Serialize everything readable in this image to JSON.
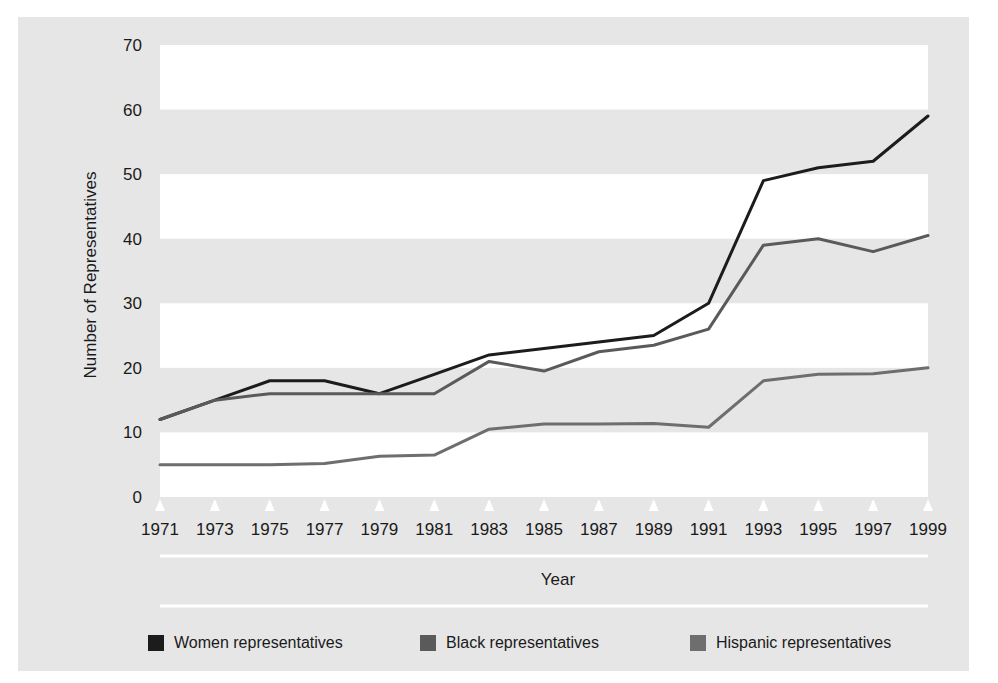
{
  "figure": {
    "background_color": "#ffffff",
    "panel_color": "#e6e6e6",
    "band_color": "#ffffff"
  },
  "axes": {
    "y_title": "Number of Representatives",
    "x_title": "Year"
  },
  "legend": {
    "items": [
      {
        "label": "Women representatives",
        "color": "#1c1c1c"
      },
      {
        "label": "Black representatives",
        "color": "#5a5a5a"
      },
      {
        "label": "Hispanic representatives",
        "color": "#6e6e6e"
      }
    ]
  },
  "chart_data": {
    "type": "line",
    "title": "",
    "xlabel": "Year",
    "ylabel": "Number of Representatives",
    "xlim": [
      1971,
      1999
    ],
    "ylim": [
      0,
      70
    ],
    "yticks": [
      0,
      10,
      20,
      30,
      40,
      50,
      60,
      70
    ],
    "grid": false,
    "banded_background": true,
    "legend_position": "bottom",
    "x": [
      1971,
      1973,
      1975,
      1977,
      1979,
      1981,
      1983,
      1985,
      1987,
      1989,
      1991,
      1993,
      1995,
      1997,
      1999
    ],
    "categories": [
      "1971",
      "1973",
      "1975",
      "1977",
      "1979",
      "1981",
      "1983",
      "1985",
      "1987",
      "1989",
      "1991",
      "1993",
      "1995",
      "1997",
      "1999"
    ],
    "series": [
      {
        "name": "Women representatives",
        "color": "#1c1c1c",
        "values": [
          12,
          15,
          18,
          18,
          16,
          19,
          22,
          23,
          24,
          25,
          30,
          49,
          51,
          52,
          59
        ]
      },
      {
        "name": "Black representatives",
        "color": "#5a5a5a",
        "values": [
          12,
          15,
          16,
          16,
          16,
          16,
          21,
          19.5,
          22.5,
          23.5,
          26,
          39,
          40,
          38,
          40.5
        ]
      },
      {
        "name": "Hispanic representatives",
        "color": "#6e6e6e",
        "values": [
          5,
          5,
          5,
          5.2,
          6.3,
          6.5,
          10.5,
          11.3,
          11.3,
          11.4,
          10.8,
          18,
          19,
          19.1,
          20
        ]
      }
    ]
  }
}
